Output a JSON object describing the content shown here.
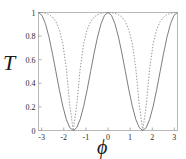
{
  "figure": {
    "background": "#ffffff",
    "frame_color": "#b5b5b5",
    "text_color": "#1a1a1a"
  },
  "axes": {
    "ylabel": "T",
    "xlabel": "ϕ",
    "x_ticks": [
      "-3",
      "-2",
      "-1",
      "0",
      "1",
      "2",
      "3"
    ],
    "x_tick_values": [
      -3,
      -2,
      -1,
      0,
      1,
      2,
      3
    ],
    "y_ticks": [
      "0",
      "0.2",
      "0.4",
      "0.6",
      "0.8",
      "1"
    ],
    "y_tick_values": [
      0,
      0.2,
      0.4,
      0.6,
      0.8,
      1
    ]
  },
  "chart_data": {
    "type": "line",
    "title": "",
    "xlabel": "ϕ",
    "ylabel": "T",
    "xlim": [
      -3.14159,
      3.14159
    ],
    "ylim": [
      0,
      1
    ],
    "grid": false,
    "legend": "none",
    "x_ticks": [
      -3,
      -2,
      -1,
      0,
      1,
      2,
      3
    ],
    "y_ticks": [
      0,
      0.2,
      0.4,
      0.6,
      0.8,
      1
    ],
    "series": [
      {
        "name": "solid-curve",
        "style": "solid",
        "color": "#6e6e6e",
        "width": 0.9,
        "description": "Broad transmission fringes, maxima T=1 at phi=0 and phi=+/-pi, zeros at phi=+/-pi/2",
        "x": [
          -3.14159,
          -2.98451,
          -2.82743,
          -2.67035,
          -2.51327,
          -2.35619,
          -2.19911,
          -2.04204,
          -1.88496,
          -1.72788,
          -1.5708,
          -1.41372,
          -1.25664,
          -1.09956,
          -0.94248,
          -0.7854,
          -0.62832,
          -0.47124,
          -0.31416,
          -0.15708,
          0,
          0.15708,
          0.31416,
          0.47124,
          0.62832,
          0.7854,
          0.94248,
          1.09956,
          1.25664,
          1.41372,
          1.5708,
          1.72788,
          1.88496,
          2.04204,
          2.19911,
          2.35619,
          2.51327,
          2.67035,
          2.82743,
          2.98451,
          3.14159
        ],
        "y": [
          1.0,
          0.976,
          0.905,
          0.794,
          0.655,
          0.5,
          0.345,
          0.206,
          0.095,
          0.024,
          0.0,
          0.024,
          0.095,
          0.206,
          0.345,
          0.5,
          0.655,
          0.794,
          0.905,
          0.976,
          1.0,
          0.976,
          0.905,
          0.794,
          0.655,
          0.5,
          0.345,
          0.206,
          0.095,
          0.024,
          0.0,
          0.024,
          0.095,
          0.206,
          0.345,
          0.5,
          0.655,
          0.794,
          0.905,
          0.976,
          1.0
        ]
      },
      {
        "name": "dotted-curve",
        "style": "dotted",
        "color": "#8a8a8a",
        "width": 0.9,
        "description": "Narrow (sharper) transmission fringes, same maxima and zeros but steeper flanks",
        "x": [
          -3.14159,
          -2.98451,
          -2.82743,
          -2.67035,
          -2.51327,
          -2.35619,
          -2.19911,
          -2.04204,
          -1.88496,
          -1.72788,
          -1.5708,
          -1.41372,
          -1.25664,
          -1.09956,
          -0.94248,
          -0.7854,
          -0.62832,
          -0.47124,
          -0.31416,
          -0.15708,
          0,
          0.15708,
          0.31416,
          0.47124,
          0.62832,
          0.7854,
          0.94248,
          1.09956,
          1.25664,
          1.41372,
          1.5708,
          1.72788,
          1.88496,
          2.04204,
          2.19911,
          2.35619,
          2.51327,
          2.67035,
          2.82743,
          2.98451,
          3.14159
        ],
        "y": [
          1.0,
          0.999,
          0.993,
          0.982,
          0.961,
          0.923,
          0.855,
          0.735,
          0.527,
          0.213,
          0.0,
          0.213,
          0.527,
          0.735,
          0.855,
          0.923,
          0.961,
          0.982,
          0.993,
          0.999,
          1.0,
          0.999,
          0.993,
          0.982,
          0.961,
          0.923,
          0.855,
          0.735,
          0.527,
          0.213,
          0.0,
          0.213,
          0.527,
          0.735,
          0.855,
          0.923,
          0.961,
          0.982,
          0.993,
          0.999,
          1.0
        ]
      }
    ]
  }
}
